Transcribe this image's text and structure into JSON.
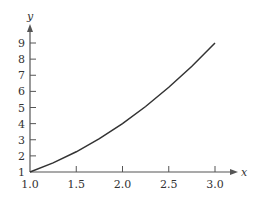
{
  "chart_data": {
    "type": "line",
    "title": "",
    "xlabel": "x",
    "ylabel": "y",
    "xlim": [
      1.0,
      3.0
    ],
    "ylim": [
      1,
      9
    ],
    "grid": false,
    "legend": null,
    "x_ticks": [
      "1.0",
      "1.5",
      "2.0",
      "2.5",
      "3.0"
    ],
    "y_ticks": [
      "1",
      "2",
      "3",
      "4",
      "5",
      "6",
      "7",
      "8",
      "9"
    ],
    "series": [
      {
        "name": "y = x^2",
        "x": [
          1.0,
          1.25,
          1.5,
          1.75,
          2.0,
          2.25,
          2.5,
          2.75,
          3.0
        ],
        "values": [
          1.0,
          1.5625,
          2.25,
          3.0625,
          4.0,
          5.0625,
          6.25,
          7.5625,
          9.0
        ]
      }
    ],
    "colors": {
      "curve": "#333333",
      "axes": "#555555"
    }
  }
}
